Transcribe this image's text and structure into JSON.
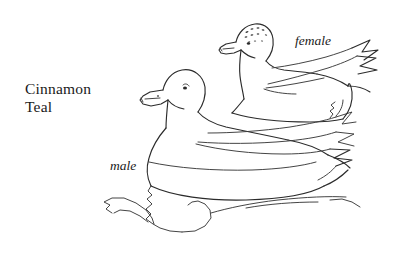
{
  "illustration": {
    "kind": "pen-and-ink line drawing",
    "subject": "Cinnamon Teal pair swimming on water",
    "background_color": "#ffffff",
    "ink_color": "#2b2b2b",
    "caption": {
      "species_line_1": "Cinnamon",
      "species_line_2": "Teal"
    },
    "annotations": [
      {
        "id": "male",
        "label": "male",
        "style": "italic"
      },
      {
        "id": "female",
        "label": "female",
        "style": "italic"
      }
    ],
    "figures": [
      {
        "id": "male-duck",
        "label": "male",
        "position": "foreground, lower left",
        "facing": "left",
        "features": [
          "rounded crown",
          "long flat bill",
          "dark eye",
          "nostril dot",
          "long pointed wing feathers",
          "pointed tail feathers"
        ]
      },
      {
        "id": "female-duck",
        "label": "female",
        "position": "background, upper right",
        "facing": "left",
        "features": [
          "stippled speckled crown",
          "long flat bill",
          "dark eye",
          "folded wing",
          "pointed tail feathers"
        ]
      }
    ],
    "water": {
      "id": "water-line",
      "description": "wavy waterline and reflection squiggles beneath the ducks"
    }
  }
}
